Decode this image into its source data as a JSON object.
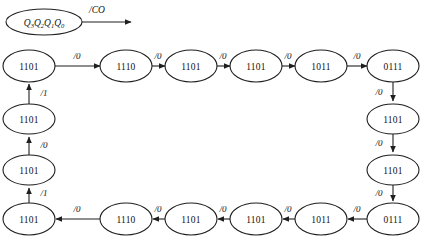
{
  "diagram": {
    "register": {
      "label_base": "Q",
      "subscripts": [
        "3",
        "2",
        "1",
        "0"
      ],
      "full_label": "Q3Q2Q1Q0",
      "output_label": "/CO",
      "output_arrow_name": "carry-out-arrow"
    },
    "colors": {
      "background": "#ffffff",
      "stroke": "#1f1f1f",
      "text": "#111111",
      "node_fill": "#ffffff"
    },
    "top_row": {
      "states": [
        "1101",
        "1110",
        "1101",
        "1101",
        "1011",
        "0111"
      ],
      "edge_labels": [
        "/0",
        "/0",
        "/0",
        "/0",
        "/0"
      ],
      "direction": "left-to-right"
    },
    "right_column": {
      "states": [
        "1101",
        "1101"
      ],
      "edge_labels": [
        "/0",
        "/0",
        "/0"
      ],
      "direction": "top-to-bottom"
    },
    "bottom_row": {
      "states": [
        "1101",
        "1110",
        "1101",
        "1101",
        "1011",
        "0111"
      ],
      "edge_labels": [
        "/0",
        "/0",
        "/0",
        "/0",
        "/0"
      ],
      "direction": "right-to-left"
    },
    "left_column": {
      "states": [
        "1101",
        "1101"
      ],
      "edge_labels": [
        "/1",
        "/0",
        "/1"
      ],
      "direction": "bottom-to-top"
    }
  }
}
